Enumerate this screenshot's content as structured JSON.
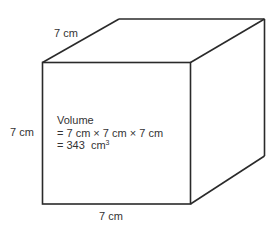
{
  "diagram": {
    "type": "cube",
    "edge_length": "7 cm",
    "labels": {
      "top_edge": "7 cm",
      "left_edge": "7 cm",
      "bottom_edge": "7 cm"
    },
    "volume": {
      "title": "Volume",
      "line1": "= 7 cm × 7 cm × 7 cm",
      "line2_prefix": "= 343  cm",
      "line2_exponent": "3"
    },
    "colors": {
      "stroke": "#2a2a2a",
      "text": "#333333",
      "background": "#ffffff"
    }
  }
}
